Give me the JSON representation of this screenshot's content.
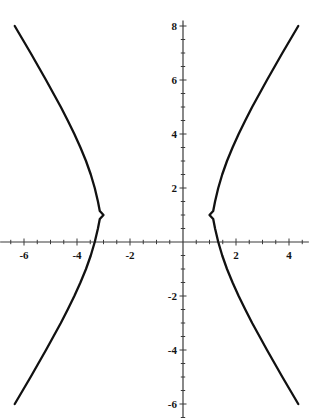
{
  "chart_data": {
    "type": "line",
    "title": "",
    "xlabel": "",
    "ylabel": "",
    "xlim": [
      -6.9,
      4.75
    ],
    "ylim": [
      -6.5,
      8.2
    ],
    "grid": false,
    "legend": null,
    "xticks": [
      -6,
      -4,
      -2,
      2,
      4
    ],
    "xtick_labels": [
      "-6",
      "-4",
      "-2",
      "2",
      "4"
    ],
    "yticks": [
      8,
      6,
      4,
      2,
      -2,
      -4,
      -6
    ],
    "ytick_labels": [
      "8",
      "6",
      "4",
      "2",
      "-2",
      "-4",
      "-6"
    ],
    "minor_tick_step": 0.5,
    "curve_color": "#111111",
    "axis_color": "#3a3a3a",
    "equation": "(x+1)^2/4 - (y-1)^2/9 = 1",
    "center": [
      -1,
      1
    ],
    "a": 2,
    "b": 3,
    "vertices": [
      [
        -3,
        1
      ],
      [
        1,
        1
      ]
    ],
    "series": [
      {
        "name": "left-branch",
        "points": [
          [
            -6.35,
            8.0
          ],
          [
            -6.05,
            7.5
          ],
          [
            -5.75,
            7.0
          ],
          [
            -5.46,
            6.5
          ],
          [
            -5.17,
            6.0
          ],
          [
            -4.89,
            5.5
          ],
          [
            -4.61,
            5.0
          ],
          [
            -4.35,
            4.5
          ],
          [
            -4.1,
            4.0
          ],
          [
            -3.87,
            3.5
          ],
          [
            -3.66,
            3.0
          ],
          [
            -3.48,
            2.5
          ],
          [
            -3.33,
            2.0
          ],
          [
            -3.21,
            1.5
          ],
          [
            -3.14,
            1.15
          ],
          [
            -3.0,
            1.0
          ],
          [
            -3.14,
            0.85
          ],
          [
            -3.21,
            0.5
          ],
          [
            -3.33,
            0.0
          ],
          [
            -3.48,
            -0.5
          ],
          [
            -3.66,
            -1.0
          ],
          [
            -3.87,
            -1.5
          ],
          [
            -4.1,
            -2.0
          ],
          [
            -4.35,
            -2.5
          ],
          [
            -4.61,
            -3.0
          ],
          [
            -4.89,
            -3.5
          ],
          [
            -5.17,
            -4.0
          ],
          [
            -5.46,
            -4.5
          ],
          [
            -5.75,
            -5.0
          ],
          [
            -6.05,
            -5.5
          ],
          [
            -6.35,
            -6.0
          ]
        ]
      },
      {
        "name": "right-branch",
        "points": [
          [
            4.35,
            8.0
          ],
          [
            4.05,
            7.5
          ],
          [
            3.75,
            7.0
          ],
          [
            3.46,
            6.5
          ],
          [
            3.17,
            6.0
          ],
          [
            2.89,
            5.5
          ],
          [
            2.61,
            5.0
          ],
          [
            2.35,
            4.5
          ],
          [
            2.1,
            4.0
          ],
          [
            1.87,
            3.5
          ],
          [
            1.66,
            3.0
          ],
          [
            1.48,
            2.5
          ],
          [
            1.33,
            2.0
          ],
          [
            1.21,
            1.5
          ],
          [
            1.14,
            1.15
          ],
          [
            1.0,
            1.0
          ],
          [
            1.14,
            0.85
          ],
          [
            1.21,
            0.5
          ],
          [
            1.33,
            0.0
          ],
          [
            1.48,
            -0.5
          ],
          [
            1.66,
            -1.0
          ],
          [
            1.87,
            -1.5
          ],
          [
            2.1,
            -2.0
          ],
          [
            2.35,
            -2.5
          ],
          [
            2.61,
            -3.0
          ],
          [
            2.89,
            -3.5
          ],
          [
            3.17,
            -4.0
          ],
          [
            3.46,
            -4.5
          ],
          [
            3.75,
            -5.0
          ],
          [
            4.05,
            -5.5
          ],
          [
            4.35,
            -6.0
          ]
        ]
      }
    ]
  },
  "figure": {
    "clipped_header_text": "",
    "origin_px": [
      183,
      242
    ],
    "px_per_unit_x": 26.5,
    "px_per_unit_y": 27.0
  }
}
